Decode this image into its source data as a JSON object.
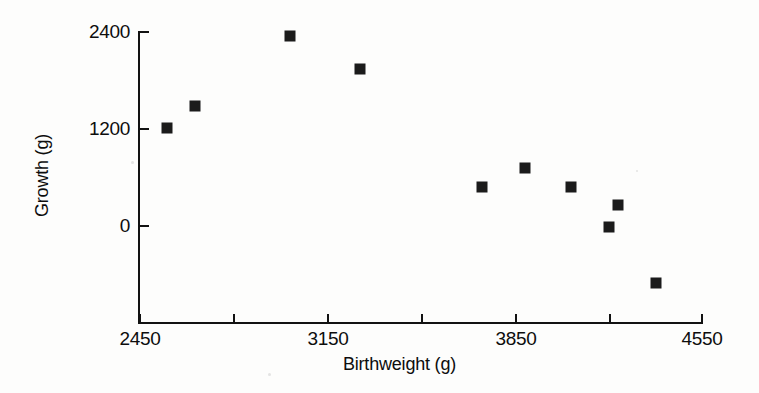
{
  "chart_data": {
    "type": "scatter",
    "title": "",
    "xlabel": "Birthweight (g)",
    "ylabel": "Growth (g)",
    "xlim": [
      2450,
      4550
    ],
    "ylim": [
      -1200,
      2400
    ],
    "grid": false,
    "legend": null,
    "marker": "filled-square",
    "marker_color": "#1b1b1b",
    "x_ticks": [
      2450,
      2800,
      3150,
      3500,
      3850,
      4200,
      4550
    ],
    "x_tick_labels": [
      "2450",
      "",
      "3150",
      "",
      "3850",
      "",
      "4550"
    ],
    "y_ticks": [
      2400,
      1200,
      0
    ],
    "y_tick_labels": [
      "2400",
      "1200",
      "0"
    ],
    "x": [
      2550,
      2655,
      3010,
      3275,
      3730,
      3890,
      4065,
      4240,
      4205,
      4380
    ],
    "y": [
      1200,
      1470,
      2340,
      1935,
      465,
      710,
      465,
      245,
      -25,
      -720
    ],
    "points": [
      {
        "birthweight": 2550,
        "growth": 1200
      },
      {
        "birthweight": 2655,
        "growth": 1470
      },
      {
        "birthweight": 3010,
        "growth": 2340
      },
      {
        "birthweight": 3275,
        "growth": 1935
      },
      {
        "birthweight": 3730,
        "growth": 465
      },
      {
        "birthweight": 3890,
        "growth": 710
      },
      {
        "birthweight": 4065,
        "growth": 465
      },
      {
        "birthweight": 4240,
        "growth": 245
      },
      {
        "birthweight": 4205,
        "growth": -25
      },
      {
        "birthweight": 4380,
        "growth": -720
      }
    ]
  },
  "axes": {
    "x_title": "Birthweight (g)",
    "y_title": "Growth (g)",
    "x_tick_labels": [
      "2450",
      "3150",
      "3850",
      "4550"
    ],
    "y_tick_labels": [
      "2400",
      "1200",
      "0"
    ]
  }
}
